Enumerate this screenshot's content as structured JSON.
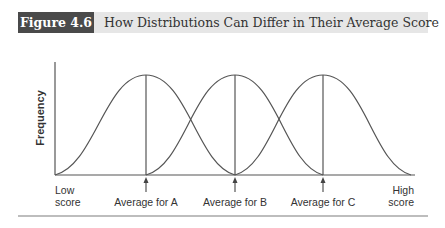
{
  "header": {
    "figure_label": "Figure 4.6",
    "title": "How Distributions Can Differ in Their Average Score"
  },
  "diagram": {
    "y_axis_label": "Frequency",
    "x_axis_low_label_line1": "Low",
    "x_axis_low_label_line2": "score",
    "x_axis_high_label_line1": "High",
    "x_axis_high_label_line2": "score",
    "curves": [
      {
        "name": "A",
        "mean_label": "Average for A"
      },
      {
        "name": "B",
        "mean_label": "Average for B"
      },
      {
        "name": "C",
        "mean_label": "Average for C"
      }
    ],
    "colors": {
      "line": "#555555",
      "header_tag_bg": "#4a4a4a",
      "header_bg": "#e6e6e6"
    }
  }
}
